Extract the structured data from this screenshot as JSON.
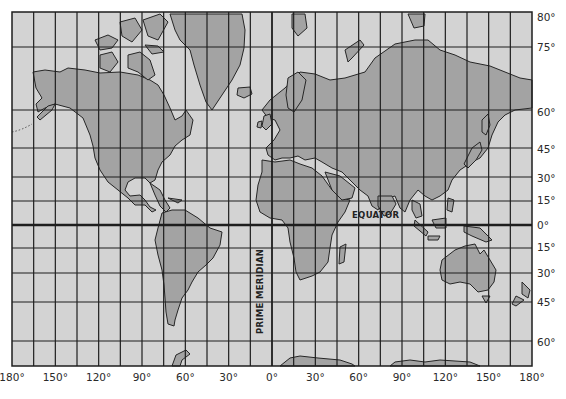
{
  "map": {
    "projection": "Mercator",
    "frame": {
      "left": 12,
      "top": 12,
      "right": 532,
      "bottom": 366
    },
    "colors": {
      "ocean": "#d3d3d3",
      "land": "#a3a3a3",
      "grid": "#1e1e1e",
      "outline": "#262626",
      "paper": "#ffffff"
    },
    "longitude_labels": [
      "180°",
      "150°",
      "120°",
      "90°",
      "60°",
      "30°",
      "0°",
      "30°",
      "60°",
      "90°",
      "120°",
      "150°",
      "180°"
    ],
    "latitude_labels": [
      {
        "label": "80°",
        "y": 17
      },
      {
        "label": "75°",
        "y": 47
      },
      {
        "label": "60°",
        "y": 112
      },
      {
        "label": "45°",
        "y": 149
      },
      {
        "label": "30°",
        "y": 178
      },
      {
        "label": "15°",
        "y": 200
      },
      {
        "label": "0°",
        "y": 225
      },
      {
        "label": "15°",
        "y": 247
      },
      {
        "label": "30°",
        "y": 273
      },
      {
        "label": "45°",
        "y": 302
      },
      {
        "label": "60°",
        "y": 342
      }
    ],
    "horizontal_grid_y": [
      47,
      110,
      148,
      177,
      201,
      225,
      248,
      273,
      302,
      341
    ],
    "equator_y": 225,
    "prime_meridian_x": 272,
    "equator_label": "EQUATOR",
    "prime_meridian_label": "PRIME MERIDIAN",
    "caption": "Figure 1-2. World map on a Mercator projection."
  }
}
